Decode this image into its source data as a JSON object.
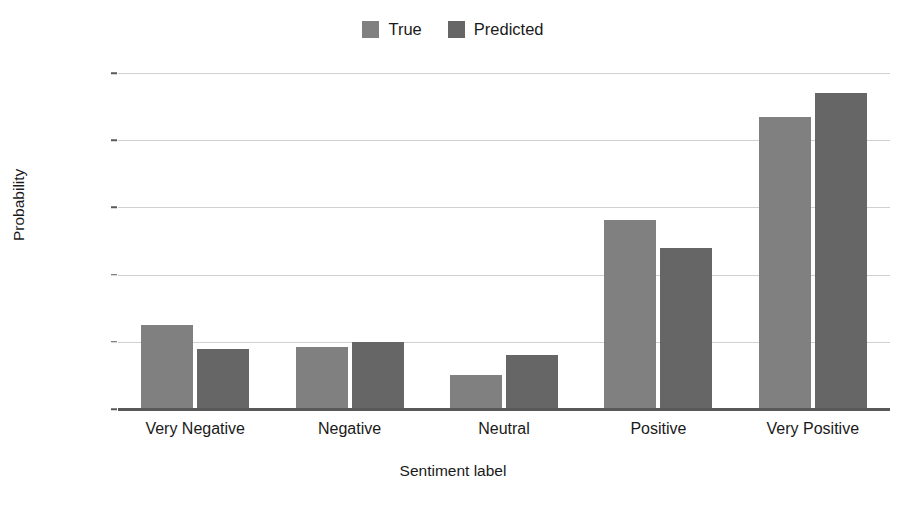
{
  "chart_data": {
    "type": "bar",
    "title": "",
    "xlabel": "Sentiment label",
    "ylabel": "Probability",
    "categories": [
      "Very Negative",
      "Negative",
      "Neutral",
      "Positive",
      "Very Positive"
    ],
    "series": [
      {
        "name": "True",
        "values": [
          0.125,
          0.093,
          0.05,
          0.281,
          0.435
        ],
        "color": "#808080"
      },
      {
        "name": "Predicted",
        "values": [
          0.09,
          0.1,
          0.08,
          0.24,
          0.47
        ],
        "color": "#666666"
      }
    ],
    "ylim": [
      0.0,
      0.5
    ],
    "yticks": [
      0.0,
      0.1,
      0.2,
      0.3,
      0.4,
      0.5
    ],
    "ytick_labels": [
      "0.0",
      "0.1",
      "0.2",
      "0.3",
      "0.4",
      "0.5"
    ],
    "grid": true,
    "grid_color": "#d0d0d0",
    "legend_position": "top-center",
    "background_color": "#ffffff",
    "axis_color": "#595959"
  }
}
